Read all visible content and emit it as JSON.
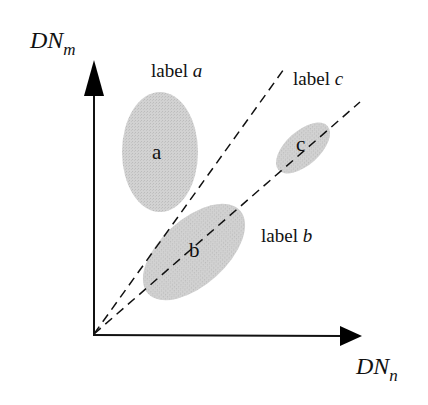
{
  "diagram": {
    "axes": {
      "y": {
        "main": "DN",
        "sub": "m"
      },
      "x": {
        "main": "DN",
        "sub": "n"
      }
    },
    "labels": {
      "a": {
        "text": "label ",
        "var": "a"
      },
      "b": {
        "text": "label ",
        "var": "b"
      },
      "c": {
        "text": "label ",
        "var": "c"
      }
    },
    "clusters": [
      {
        "id": "a",
        "letter": "a"
      },
      {
        "id": "b",
        "letter": "b"
      },
      {
        "id": "c",
        "letter": "c"
      }
    ],
    "colors": {
      "cluster_fill": "#cfcfcf",
      "line": "#111111"
    }
  }
}
